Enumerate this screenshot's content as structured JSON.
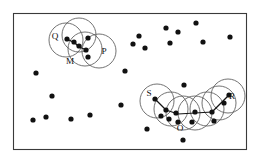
{
  "figure": {
    "canvas": {
      "width": 258,
      "height": 162
    },
    "frame": {
      "x": 13.5,
      "y": 13.5,
      "width": 233,
      "height": 136
    },
    "colors": {
      "background": "#ffffff",
      "frame_stroke": "#3a3a3a",
      "circle_stroke": "#5a5a5a",
      "dot_fill": "#111111",
      "link_stroke": "#141414"
    }
  },
  "chart_data": {
    "type": "scatter",
    "xlabel": "",
    "ylabel": "",
    "xlim": [
      13.5,
      246.5
    ],
    "ylim": [
      13.5,
      149.5
    ],
    "grid": false,
    "legend": null,
    "annotations": [
      {
        "label": "Q",
        "x": 55,
        "y": 37
      },
      {
        "label": "M",
        "x": 70,
        "y": 62
      },
      {
        "label": "P",
        "x": 104,
        "y": 52
      },
      {
        "label": "S",
        "x": 149,
        "y": 94
      },
      {
        "label": "O",
        "x": 180,
        "y": 129
      },
      {
        "label": "R",
        "x": 232,
        "y": 97
      }
    ],
    "series": [
      {
        "name": "cluster-1-cover-circles",
        "type": "circles",
        "radius": 17,
        "points": [
          {
            "x": 66,
            "y": 40
          },
          {
            "x": 79,
            "y": 35
          },
          {
            "x": 85,
            "y": 49
          },
          {
            "x": 99,
            "y": 51
          }
        ]
      },
      {
        "name": "cluster-2-cover-circles",
        "type": "circles",
        "radius": 17,
        "points": [
          {
            "x": 157,
            "y": 101
          },
          {
            "x": 171,
            "y": 109
          },
          {
            "x": 183,
            "y": 113
          },
          {
            "x": 195,
            "y": 113
          },
          {
            "x": 207,
            "y": 109
          },
          {
            "x": 219,
            "y": 103
          },
          {
            "x": 228,
            "y": 96
          }
        ]
      },
      {
        "name": "cluster-1-core-points",
        "type": "dots",
        "radius": 2.6,
        "points": [
          {
            "x": 67,
            "y": 39
          },
          {
            "x": 74,
            "y": 42
          },
          {
            "x": 79,
            "y": 46
          },
          {
            "x": 86,
            "y": 50
          },
          {
            "x": 88,
            "y": 38
          },
          {
            "x": 88,
            "y": 57
          }
        ]
      },
      {
        "name": "cluster-2-core-points",
        "type": "dots",
        "radius": 2.6,
        "points": [
          {
            "x": 155,
            "y": 99
          },
          {
            "x": 166,
            "y": 110
          },
          {
            "x": 161,
            "y": 116
          },
          {
            "x": 169,
            "y": 119
          },
          {
            "x": 176,
            "y": 113
          },
          {
            "x": 178,
            "y": 122
          },
          {
            "x": 192,
            "y": 122
          },
          {
            "x": 195,
            "y": 112
          },
          {
            "x": 212,
            "y": 112
          },
          {
            "x": 214,
            "y": 121
          },
          {
            "x": 224,
            "y": 103
          },
          {
            "x": 229,
            "y": 95
          }
        ]
      },
      {
        "name": "background-noise-points",
        "type": "dots",
        "radius": 2.6,
        "points": [
          {
            "x": 36,
            "y": 73
          },
          {
            "x": 52,
            "y": 96
          },
          {
            "x": 33,
            "y": 120
          },
          {
            "x": 46,
            "y": 117
          },
          {
            "x": 71,
            "y": 119
          },
          {
            "x": 90,
            "y": 115
          },
          {
            "x": 125,
            "y": 71
          },
          {
            "x": 121,
            "y": 105
          },
          {
            "x": 133,
            "y": 44
          },
          {
            "x": 139,
            "y": 36
          },
          {
            "x": 145,
            "y": 48
          },
          {
            "x": 147,
            "y": 129
          },
          {
            "x": 166,
            "y": 28
          },
          {
            "x": 170,
            "y": 43
          },
          {
            "x": 178,
            "y": 32
          },
          {
            "x": 184,
            "y": 85
          },
          {
            "x": 183,
            "y": 140
          },
          {
            "x": 196,
            "y": 23
          },
          {
            "x": 203,
            "y": 42
          },
          {
            "x": 230,
            "y": 37
          }
        ]
      },
      {
        "name": "cluster-1-links",
        "type": "segments",
        "segments": [
          {
            "x1": 67,
            "y1": 39,
            "x2": 75,
            "y2": 43
          },
          {
            "x1": 75,
            "y1": 43,
            "x2": 79,
            "y2": 47
          },
          {
            "x1": 79,
            "y1": 47,
            "x2": 87,
            "y2": 50
          }
        ]
      },
      {
        "name": "cluster-2-links",
        "type": "segments",
        "segments": [
          {
            "x1": 155,
            "y1": 99,
            "x2": 166,
            "y2": 110
          },
          {
            "x1": 166,
            "y1": 110,
            "x2": 178,
            "y2": 114
          },
          {
            "x1": 178,
            "y1": 114,
            "x2": 195,
            "y2": 113
          },
          {
            "x1": 195,
            "y1": 113,
            "x2": 212,
            "y2": 112
          },
          {
            "x1": 212,
            "y1": 112,
            "x2": 229,
            "y2": 95
          }
        ]
      }
    ]
  }
}
